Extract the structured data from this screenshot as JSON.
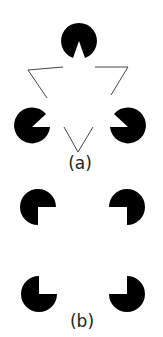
{
  "figure": {
    "panels": [
      {
        "label": "(a)",
        "description": "Kanizsa triangle: three pac-man inducers and three line-angle inducers"
      },
      {
        "label": "(b)",
        "description": "Kanizsa square: four quarter-cut disc inducers"
      }
    ],
    "colors": {
      "ink": "#000000",
      "background": "#ffffff",
      "line": "#555555"
    }
  }
}
